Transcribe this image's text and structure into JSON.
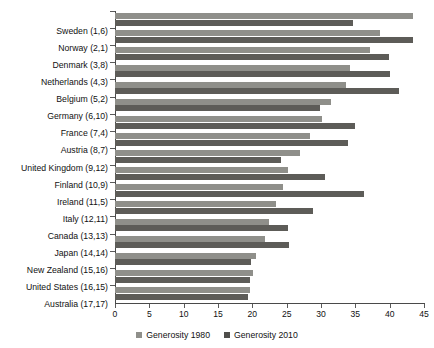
{
  "chart_data": {
    "type": "bar",
    "orientation": "horizontal",
    "title": "",
    "xlabel": "",
    "ylabel": "",
    "xlim": [
      0,
      45
    ],
    "xticks": [
      0,
      5,
      10,
      15,
      20,
      25,
      30,
      35,
      40,
      45
    ],
    "grid": false,
    "legend_position": "bottom-center",
    "categories": [
      "Sweden (1,6)",
      "Norway (2,1)",
      "Denmark (3,8)",
      "Netherlands (4,3)",
      "Belgium (5,2)",
      "Germany (6,10)",
      "France (7,4)",
      "Austria (8,7)",
      "United Kingdom (9,12)",
      "Finland (10,9)",
      "Ireland (11,5)",
      "Italy (12,11)",
      "Canada (13,13)",
      "Japan (14,14)",
      "New Zealand (15,16)",
      "United States (16,15)",
      "Australia (17,17)"
    ],
    "series": [
      {
        "name": "Generosity 1980",
        "color": "#8f8f8a",
        "values": [
          43.4,
          38.6,
          37.2,
          34.2,
          33.6,
          31.5,
          30.1,
          28.4,
          26.9,
          25.2,
          24.4,
          23.4,
          22.4,
          21.9,
          20.5,
          20.1,
          19.6
        ]
      },
      {
        "name": "Generosity 2010",
        "color": "#5d5c58",
        "values": [
          34.6,
          43.4,
          39.9,
          40.0,
          41.4,
          29.9,
          35.0,
          33.9,
          24.2,
          30.6,
          36.3,
          28.9,
          25.2,
          25.4,
          19.8,
          19.7,
          19.3
        ]
      }
    ]
  },
  "legend": {
    "items": [
      {
        "label": "Generosity 1980"
      },
      {
        "label": "Generosity 2010"
      }
    ]
  }
}
